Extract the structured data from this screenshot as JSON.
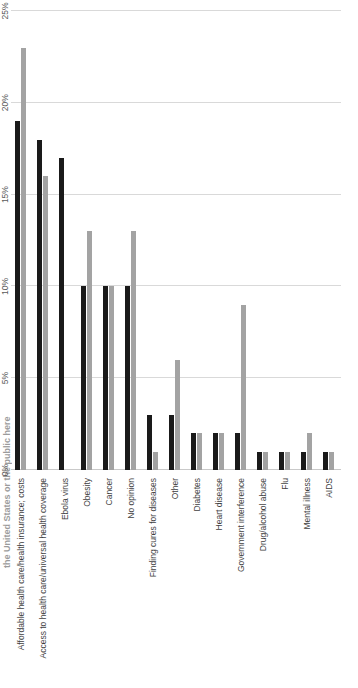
{
  "chart_data": {
    "type": "bar",
    "title": "the United States or the public here",
    "xlabel": "",
    "ylabel": "",
    "orientation": "vertical-rotated",
    "grid": true,
    "legend_position": "none",
    "ylim": [
      0,
      25
    ],
    "ytick_labels": [
      "0%",
      "5%",
      "10%",
      "15%",
      "20%",
      "25%"
    ],
    "ytick_values": [
      0,
      5,
      10,
      15,
      20,
      25
    ],
    "categories": [
      "Affordable health care/health insurance; costs",
      "Access to health care/universal health coverage",
      "Ebola virus",
      "Obesity",
      "Cancer",
      "No opinion",
      "Finding cures for diseases",
      "Other",
      "Diabetes",
      "Heart disease",
      "Government interference",
      "Drug/alcohol abuse",
      "Flu",
      "Mental illness",
      "AIDS"
    ],
    "series": [
      {
        "name": "Series 1",
        "color": "#1a1a1a",
        "values": [
          19,
          18,
          17,
          10,
          10,
          10,
          3,
          3,
          2,
          2,
          2,
          1,
          1,
          1,
          1
        ]
      },
      {
        "name": "Series 2",
        "color": "#a3a3a3",
        "values": [
          23,
          16,
          0,
          13,
          10,
          13,
          1,
          6,
          2,
          2,
          9,
          1,
          1,
          2,
          1
        ]
      }
    ]
  }
}
